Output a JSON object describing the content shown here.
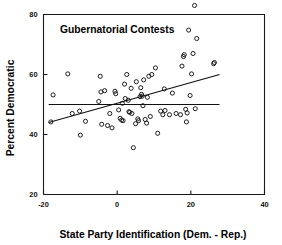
{
  "chart_data": {
    "type": "scatter",
    "title": "Gubernatorial Contests",
    "xlabel": "State Party Identification (Dem. - Rep.)",
    "ylabel": "Percent Democratic",
    "xlim": [
      -20,
      40
    ],
    "ylim": [
      20,
      80
    ],
    "xticks": [
      -20,
      0,
      20,
      40
    ],
    "yticks": [
      20,
      40,
      60,
      80
    ],
    "xticklabels": [
      "-20",
      "0",
      "20",
      "40"
    ],
    "yticklabels": [
      "20",
      "40",
      "60",
      "80"
    ],
    "grid": false,
    "legend": "none",
    "marker": "open-circle",
    "points": [
      [
        -18.0,
        44.2
      ],
      [
        -17.4,
        53.2
      ],
      [
        -13.4,
        60.2
      ],
      [
        -12.2,
        47.0
      ],
      [
        -10.2,
        47.8
      ],
      [
        -10.0,
        39.8
      ],
      [
        -8.6,
        44.4
      ],
      [
        -5.0,
        51.0
      ],
      [
        -4.6,
        59.4
      ],
      [
        -4.4,
        54.2
      ],
      [
        -4.2,
        43.4
      ],
      [
        -3.4,
        54.6
      ],
      [
        -2.6,
        43.0
      ],
      [
        -2.0,
        47.0
      ],
      [
        -1.4,
        42.2
      ],
      [
        -0.6,
        54.4
      ],
      [
        -0.4,
        53.6
      ],
      [
        0.4,
        48.2
      ],
      [
        0.8,
        45.4
      ],
      [
        1.2,
        44.8
      ],
      [
        1.4,
        50.4
      ],
      [
        1.6,
        44.6
      ],
      [
        2.0,
        56.8
      ],
      [
        2.2,
        52.0
      ],
      [
        2.6,
        60.0
      ],
      [
        3.0,
        51.4
      ],
      [
        3.2,
        47.6
      ],
      [
        3.4,
        47.4
      ],
      [
        3.8,
        55.4
      ],
      [
        4.0,
        47.0
      ],
      [
        4.4,
        35.6
      ],
      [
        5.0,
        43.6
      ],
      [
        5.2,
        57.6
      ],
      [
        5.6,
        45.2
      ],
      [
        5.8,
        44.6
      ],
      [
        6.2,
        52.6
      ],
      [
        6.4,
        55.6
      ],
      [
        6.6,
        53.4
      ],
      [
        6.8,
        52.8
      ],
      [
        7.0,
        49.6
      ],
      [
        7.2,
        58.2
      ],
      [
        7.6,
        45.0
      ],
      [
        8.0,
        43.8
      ],
      [
        8.2,
        52.4
      ],
      [
        8.6,
        59.4
      ],
      [
        9.0,
        46.0
      ],
      [
        9.4,
        60.0
      ],
      [
        10.4,
        62.2
      ],
      [
        11.0,
        40.4
      ],
      [
        11.8,
        47.8
      ],
      [
        12.4,
        46.6
      ],
      [
        12.8,
        55.2
      ],
      [
        13.0,
        48.0
      ],
      [
        14.2,
        46.6
      ],
      [
        15.0,
        53.8
      ],
      [
        16.0,
        47.0
      ],
      [
        17.2,
        46.6
      ],
      [
        17.6,
        62.8
      ],
      [
        18.0,
        66.0
      ],
      [
        18.2,
        66.6
      ],
      [
        18.6,
        48.4
      ],
      [
        18.8,
        44.2
      ],
      [
        19.0,
        47.2
      ],
      [
        19.4,
        74.8
      ],
      [
        19.8,
        53.0
      ],
      [
        20.2,
        60.2
      ],
      [
        20.6,
        67.0
      ],
      [
        21.0,
        83.0
      ],
      [
        21.2,
        48.6
      ],
      [
        21.6,
        72.0
      ],
      [
        26.2,
        63.6
      ],
      [
        26.4,
        64.0
      ]
    ],
    "lines": [
      {
        "name": "regression-line",
        "x": [
          -18.6,
          27.8
        ],
        "y": [
          44.0,
          60.0
        ]
      },
      {
        "name": "reference-line",
        "x": [
          -18.6,
          27.8
        ],
        "y": [
          50.0,
          50.0
        ]
      }
    ]
  }
}
